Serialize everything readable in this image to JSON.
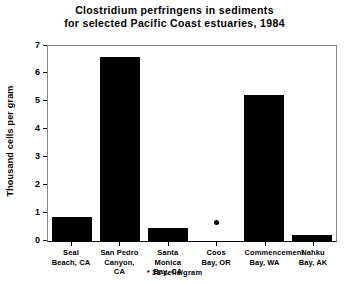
{
  "chart_data": {
    "type": "bar",
    "title": "Clostridium perfringens in sediments for selected Pacific Coast estuaries, 1984",
    "title_lines": [
      "Clostridium perfringens in sediments",
      "for selected Pacific Coast estuaries, 1984"
    ],
    "xlabel": "",
    "ylabel": "Thousand cells per gram",
    "ylim": [
      0,
      7
    ],
    "yticks": [
      0,
      1,
      2,
      3,
      4,
      5,
      6,
      7
    ],
    "ytick_labels": [
      "0",
      "1",
      "2",
      "3",
      "4",
      "5",
      "6",
      "7"
    ],
    "grid": false,
    "legend": false,
    "bar_color": "#000000",
    "categories": [
      "Seal Beach, CA",
      "San Pedro Canyon, CA",
      "Santa Monica Bay, CA",
      "Coos Bay, OR",
      "Commencement Bay, WA",
      "Nahku Bay, AK"
    ],
    "category_lines": [
      [
        "Seal",
        "Beach, CA"
      ],
      [
        "San Pedro",
        "Canyon, CA"
      ],
      [
        "Santa Monica",
        "Bay, CA"
      ],
      [
        "Coos",
        "Bay, OR"
      ],
      [
        "Commencement",
        "Bay, WA"
      ],
      [
        "Nahku",
        "Bay, AK"
      ]
    ],
    "values": [
      0.85,
      6.6,
      0.45,
      0.031,
      5.25,
      0.2
    ],
    "marker_points": [
      {
        "category": "Coos Bay, OR",
        "value": 0.031,
        "note": "31 cells/gram"
      }
    ],
    "annotations": [
      "* 31 cells/gram"
    ],
    "footnote": "* 31 cells/gram"
  }
}
